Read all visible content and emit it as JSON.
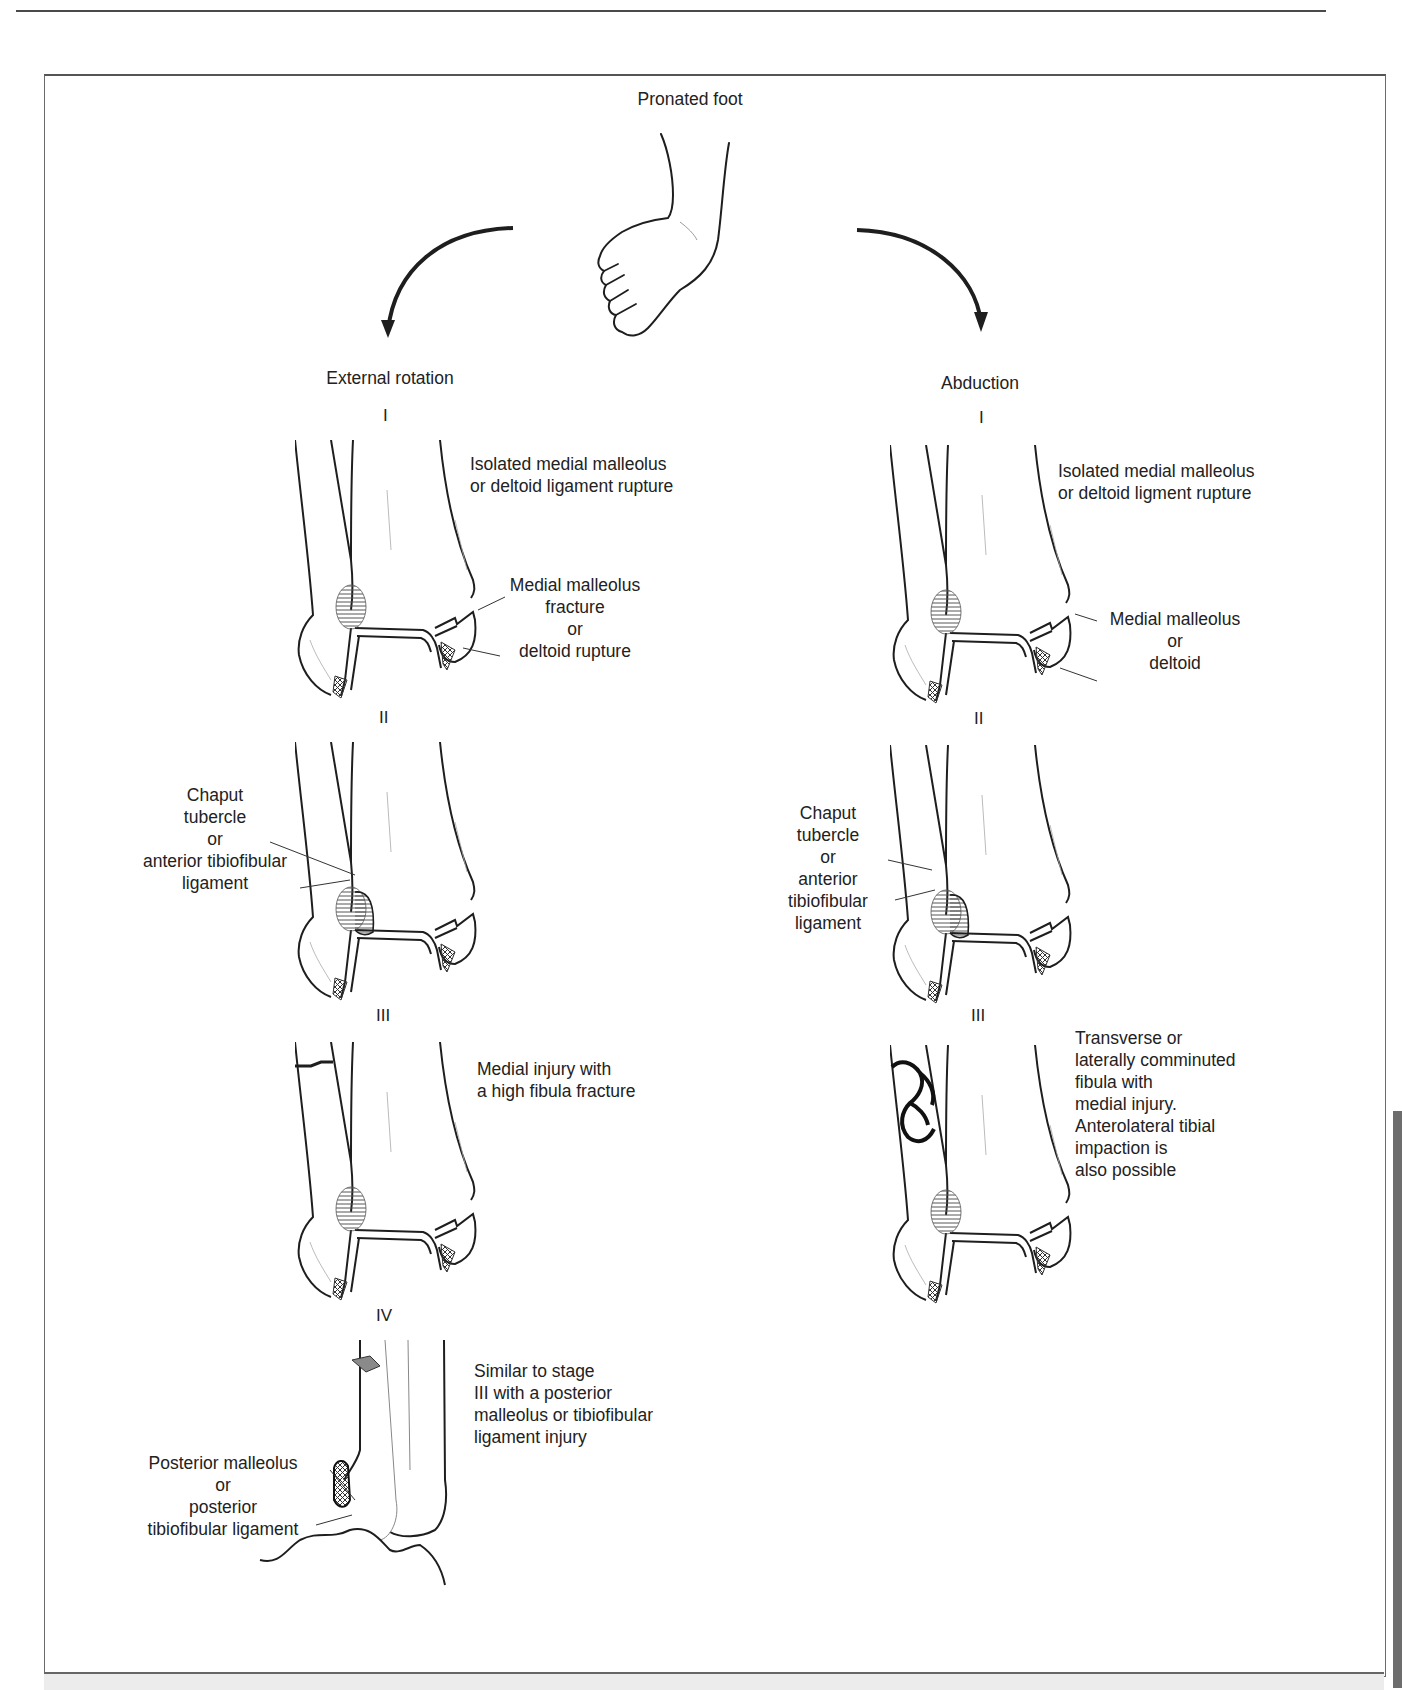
{
  "figure": {
    "title": "Pronated foot",
    "icon": "pronated-foot-illustration",
    "branches": [
      {
        "name": "External rotation",
        "stages": [
          {
            "numeral": "I",
            "description": [
              "Isolated medial malleolus",
              "or deltoid ligament rupture"
            ],
            "callouts": [
              {
                "lines": [
                  "Medial malleolus",
                  "fracture",
                  "or",
                  "deltoid rupture"
                ]
              }
            ]
          },
          {
            "numeral": "II",
            "description": [],
            "callouts": [
              {
                "lines": [
                  "Chaput",
                  "tubercle",
                  "or",
                  "anterior tibiofibular",
                  "ligament"
                ]
              }
            ]
          },
          {
            "numeral": "III",
            "description": [
              "Medial injury with",
              "a high fibula fracture"
            ],
            "callouts": []
          },
          {
            "numeral": "IV",
            "description": [
              "Similar to stage",
              "III with a posterior",
              "malleolus or tibiofibular",
              "ligament injury"
            ],
            "callouts": [
              {
                "lines": [
                  "Posterior malleolus",
                  "or",
                  "posterior",
                  "tibiofibular ligament"
                ]
              }
            ]
          }
        ]
      },
      {
        "name": "Abduction",
        "stages": [
          {
            "numeral": "I",
            "description": [
              "Isolated medial malleolus",
              "or deltoid ligment rupture"
            ],
            "callouts": [
              {
                "lines": [
                  "Medial malleolus",
                  "or",
                  "deltoid"
                ]
              }
            ]
          },
          {
            "numeral": "II",
            "description": [],
            "callouts": [
              {
                "lines": [
                  "Chaput",
                  "tubercle",
                  "or",
                  "anterior",
                  "tibiofibular",
                  "ligament"
                ]
              }
            ]
          },
          {
            "numeral": "III",
            "description": [
              "Transverse or",
              "laterally comminuted",
              "fibula with",
              "medial injury.",
              "Anterolateral tibial",
              "impaction is",
              "also possible"
            ],
            "callouts": []
          }
        ]
      }
    ],
    "colors": {
      "line": "#1e1e1e",
      "frame": "#6a6a6a",
      "side_tab": "#6d6d6d",
      "hatch": "#555555",
      "fragment": "#8a8a8a"
    }
  }
}
